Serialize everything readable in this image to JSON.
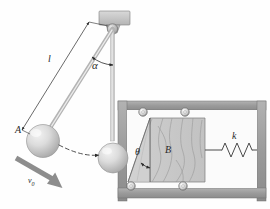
{
  "figure": {
    "type": "mechanics-diagram",
    "background_color": "#fefefe",
    "ink_color": "#2a2a2a",
    "wall_color": "#9e9e9e",
    "block_color": "#c9c9c9",
    "sphere_color": "#d5d5d5",
    "width": 270,
    "height": 209
  },
  "labels": {
    "rod_length": "l",
    "swing_angle": "α",
    "incline_angle": "θ",
    "sphere_a": "A",
    "block_b": "B",
    "spring_constant": "k",
    "initial_velocity": "v",
    "initial_velocity_sub": "0"
  },
  "parts": {
    "ceiling_support": "ceiling-bracket",
    "pivot": "pivot-pin",
    "pendulum_rod_swung": "pendulum-rod-displaced",
    "pendulum_rod_rest": "pendulum-rod-vertical",
    "sphere_displaced": "sphere-a-displaced",
    "sphere_rest": "sphere-a-at-rest",
    "trajectory": "swing-path-dashed",
    "velocity_arrow": "v0-arrow",
    "dimension_line": "length-dimension-line",
    "angle_arc_alpha": "alpha-angle-arc",
    "angle_arc_theta": "theta-angle-arc",
    "wedge": "wedge-block-b",
    "spring": "coil-spring",
    "rollers": [
      "roller-top-left",
      "roller-top-right",
      "roller-bottom-left",
      "roller-bottom-right"
    ],
    "frame": "wall-frame"
  },
  "geometry": {
    "pivot_x": 110,
    "pivot_y": 28,
    "rod_length_px": 110,
    "alpha_deg": 28,
    "theta_deg": 28,
    "sphere_radius": 15
  }
}
